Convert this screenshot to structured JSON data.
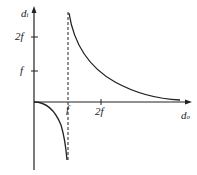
{
  "diagram": {
    "y_axis": {
      "label": "d",
      "subscript": "i"
    },
    "x_axis": {
      "label": "d",
      "subscript": "o"
    },
    "y_ticks": [
      {
        "label": "2f"
      },
      {
        "label": "f"
      }
    ],
    "x_ticks": [
      {
        "label": "f"
      },
      {
        "label": "2f"
      }
    ],
    "asymptote": "d_o = f (dashed)",
    "curves": [
      "positive branch: d_o > f, d_i decreases from +infinity toward f",
      "negative branch: 0 < d_o < f, d_i decreases from 0 to -infinity"
    ],
    "colors": {
      "line": "#222222",
      "background": "#ffffff"
    }
  }
}
